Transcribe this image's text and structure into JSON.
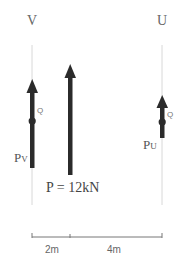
{
  "diagram": {
    "title": "",
    "colors": {
      "arrow": "#2b2b2b",
      "guide_line": "#d8d8d8",
      "dimension_line": "#777777",
      "text": "#555555"
    },
    "supports": [
      {
        "id": "V",
        "label": "V",
        "x": 32
      },
      {
        "id": "U",
        "label": "U",
        "x": 162
      }
    ],
    "forces": [
      {
        "id": "Pv",
        "label_main": "P",
        "label_sub": "V",
        "point_label": "Q",
        "direction": "up"
      },
      {
        "id": "P",
        "label": "P = 12kN",
        "direction": "up"
      },
      {
        "id": "Pu",
        "label_main": "P",
        "label_sub": "U",
        "point_label": "Q",
        "direction": "up"
      }
    ],
    "dimensions": [
      {
        "label": "2m"
      },
      {
        "label": "4m"
      }
    ]
  }
}
